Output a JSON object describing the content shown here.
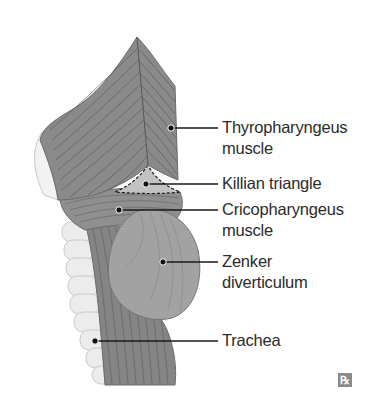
{
  "figure": {
    "colors": {
      "muscle": "#8c8c8c",
      "muscle_dark": "#6e6e6e",
      "muscle_light": "#a6a6a6",
      "diverticulum": "#9a9a9a",
      "cartilage": "#e6e6e6",
      "killian": "#c4c4c4",
      "line": "#1a1a1a",
      "text": "#2b2b2b"
    },
    "labels": [
      {
        "id": "thyropharyngeus",
        "line1": "Thyropharyngeus",
        "line2": "muscle"
      },
      {
        "id": "killian",
        "line1": "Killian triangle"
      },
      {
        "id": "cricopharyngeus",
        "line1": "Cricopharyngeus",
        "line2": "muscle"
      },
      {
        "id": "zenker",
        "line1": "Zenker",
        "line2": "diverticulum"
      },
      {
        "id": "trachea",
        "line1": "Trachea"
      }
    ],
    "logo": "℞"
  }
}
